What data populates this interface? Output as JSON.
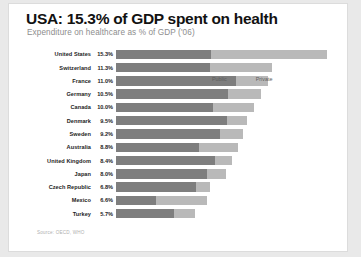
{
  "card": {
    "title": "USA: 15.3% of GDP spent on health",
    "subtitle": "Expenditure on healthcare as % of GDP ('06)",
    "source": "Source: OECD, WHO"
  },
  "legend": {
    "position": "middle-right",
    "items": [
      {
        "label": "Public",
        "color": "#7e7e7e"
      },
      {
        "label": "Private",
        "color": "#b9b9b9"
      }
    ]
  },
  "chart_data": {
    "type": "bar",
    "orientation": "horizontal",
    "stacked": true,
    "title": "USA: 15.3% of GDP spent on health",
    "subtitle": "Expenditure on healthcare as % of GDP ('06)",
    "xlabel": "",
    "ylabel": "",
    "xlim": [
      0,
      16
    ],
    "grid": false,
    "legend_position": "middle-right",
    "categories": [
      "United States",
      "Switzerland",
      "France",
      "Germany",
      "Canada",
      "Denmark",
      "Sweden",
      "Australia",
      "United Kingdom",
      "Japan",
      "Czech Republic",
      "Mexico",
      "Turkey"
    ],
    "totals": [
      15.3,
      11.3,
      11.0,
      10.5,
      10.0,
      9.5,
      9.2,
      8.8,
      8.4,
      8.0,
      6.8,
      6.6,
      5.7
    ],
    "value_labels": [
      "15.3%",
      "11.3%",
      "11.0%",
      "10.5%",
      "10.0%",
      "9.5%",
      "9.2%",
      "8.8%",
      "8.4%",
      "8.0%",
      "6.8%",
      "6.6%",
      "5.7%"
    ],
    "series": [
      {
        "name": "Public",
        "color": "#7e7e7e",
        "values": [
          6.9,
          6.8,
          8.7,
          8.1,
          7.0,
          8.0,
          7.5,
          6.0,
          7.2,
          6.6,
          5.8,
          2.9,
          4.2
        ]
      },
      {
        "name": "Private",
        "color": "#b9b9b9",
        "values": [
          8.4,
          4.5,
          2.3,
          2.4,
          3.0,
          1.5,
          1.7,
          2.8,
          1.2,
          1.4,
          1.0,
          3.7,
          1.5
        ]
      }
    ]
  }
}
